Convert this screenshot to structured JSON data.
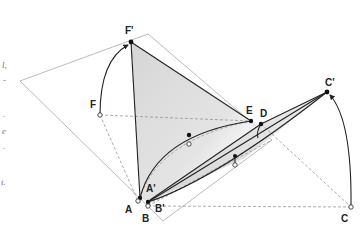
{
  "diagram": {
    "type": "geometric-folding-construction",
    "labels": {
      "F_prime": "F'",
      "F": "F",
      "E": "E",
      "D": "D",
      "C_prime": "C'",
      "C": "C",
      "A": "A",
      "A_prime": "A'",
      "B": "B",
      "B_prime": "B'"
    },
    "left_margin_fragments": [
      "l,",
      "-",
      ".",
      "e",
      ".",
      "t."
    ],
    "colors": {
      "stroke": "#222222",
      "plane": "#999999",
      "dashed": "#888888",
      "shade": "#d9d9d9"
    }
  }
}
